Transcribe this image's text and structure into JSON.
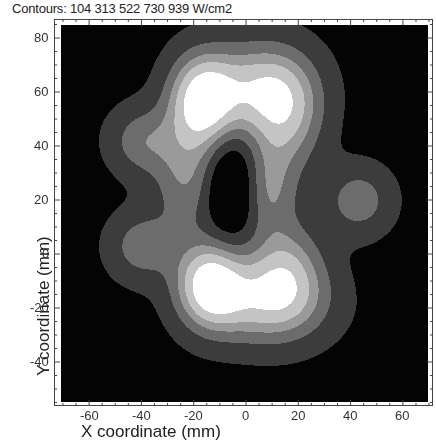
{
  "chart_data": {
    "type": "heatmap",
    "subtype": "filled-contour",
    "title": "Contours: 104  313  522  730  939 W/cm2",
    "contour_levels": [
      104,
      313,
      522,
      730,
      939
    ],
    "contour_unit": "W/cm2",
    "xlabel": "X coordinate (mm)",
    "ylabel": "Y coordinate (mm)",
    "xticks": [
      -60,
      -40,
      -20,
      0,
      20,
      40,
      60
    ],
    "yticks": [
      -40,
      -20,
      0,
      20,
      40,
      60,
      80
    ],
    "xlim": [
      -73.7,
      71
    ],
    "ylim": [
      -56,
      86.7
    ],
    "grid": false,
    "legend": "none",
    "colormap": "grayscale",
    "level_colors": [
      "#040404",
      "#3c3c3c",
      "#6c6c6c",
      "#9a9a9a",
      "#c4c4c4",
      "#ffffff"
    ],
    "approximate_features": [
      {
        "label": "peak-upper",
        "x": -17.6,
        "y": 57,
        "level": 5
      },
      {
        "label": "peak-lower",
        "x": -14.5,
        "y": -11.5,
        "level": 5
      },
      {
        "label": "side-blob-left-upper",
        "x": -40,
        "y": 42,
        "level": 2
      },
      {
        "label": "side-blob-left-lower",
        "x": -40,
        "y": 3,
        "level": 2
      },
      {
        "label": "side-blob-right",
        "x": 43,
        "y": 20,
        "level": 2
      },
      {
        "label": "central-hole",
        "x": -5,
        "y": 25,
        "level": 2
      }
    ],
    "note": "Feature positions are visual estimates; contour field is an approximate procedural model, not verified against the source image."
  },
  "title": "Contours: 104  313  522  730  939 W/cm2",
  "axes": {
    "xlabel": "X coordinate (mm)",
    "ylabel": "Y coordinate (mm)",
    "xtick_labels": [
      "-60",
      "-40",
      "-20",
      "0",
      "20",
      "40",
      "60"
    ],
    "ytick_labels": [
      "80",
      "60",
      "40",
      "20",
      "0",
      "-20",
      "-40"
    ]
  }
}
